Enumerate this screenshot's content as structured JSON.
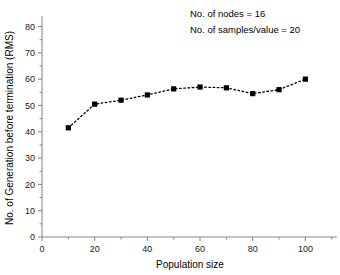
{
  "chart_data": {
    "type": "line",
    "title": "",
    "xlabel": "Population size",
    "ylabel": "No. of Generation before termination (RMS)",
    "x": [
      10,
      20,
      30,
      40,
      50,
      60,
      70,
      80,
      90,
      100
    ],
    "values": [
      41.5,
      50.5,
      52.0,
      54.0,
      56.3,
      57.0,
      56.7,
      54.5,
      56.0,
      60.0
    ],
    "series": [
      {
        "name": "Generations before termination",
        "values": [
          41.5,
          50.5,
          52.0,
          54.0,
          56.3,
          57.0,
          56.7,
          54.5,
          56.0,
          60.0
        ]
      }
    ],
    "xlim": [
      0,
      112
    ],
    "ylim": [
      0,
      84
    ],
    "xticks": [
      0,
      20,
      40,
      60,
      80,
      100
    ],
    "xtick_labels": [
      "0",
      "20",
      "40",
      "60",
      "80",
      "100"
    ],
    "xminor_ticks": [
      10,
      30,
      50,
      70,
      90,
      110
    ],
    "yticks": [
      0,
      10,
      20,
      30,
      40,
      50,
      60,
      70,
      80
    ],
    "ytick_labels": [
      "0",
      "10",
      "20",
      "30",
      "40",
      "50",
      "60",
      "70",
      "80"
    ],
    "yminor_ticks": [
      5,
      15,
      25,
      35,
      45,
      55,
      65,
      75
    ],
    "grid": false,
    "legend": "none",
    "marker": "square",
    "line_style": "dotted",
    "line_color": "#000000",
    "marker_color": "#000000",
    "axis_color": "#8a8a8a",
    "background_color": "#ffffff",
    "annotations": [
      {
        "text": "No. of nodes = 16",
        "x": 58,
        "y": 80
      },
      {
        "text": "No. of samples/value = 20",
        "x": 58,
        "y": 74
      }
    ]
  },
  "annotation_lines": {
    "line1": "No. of nodes = 16",
    "line2": "No. of samples/value = 20"
  }
}
